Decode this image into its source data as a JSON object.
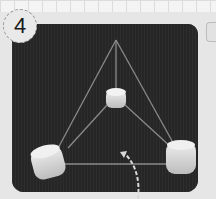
{
  "step": {
    "number": "4"
  },
  "photo": {
    "description": "Marshmallow and toothpick tetrahedron on dark background",
    "background_color": "#262626",
    "marshmallows": [
      {
        "name": "top",
        "cx": 104,
        "cy": 74
      },
      {
        "name": "bottom-left",
        "cx": 36,
        "cy": 138
      },
      {
        "name": "bottom-right",
        "cx": 169,
        "cy": 134
      }
    ],
    "apex": {
      "x": 104,
      "y": 16
    }
  },
  "annotation": {
    "arrow": "dashed curved arrow pointing to bottom edge"
  }
}
